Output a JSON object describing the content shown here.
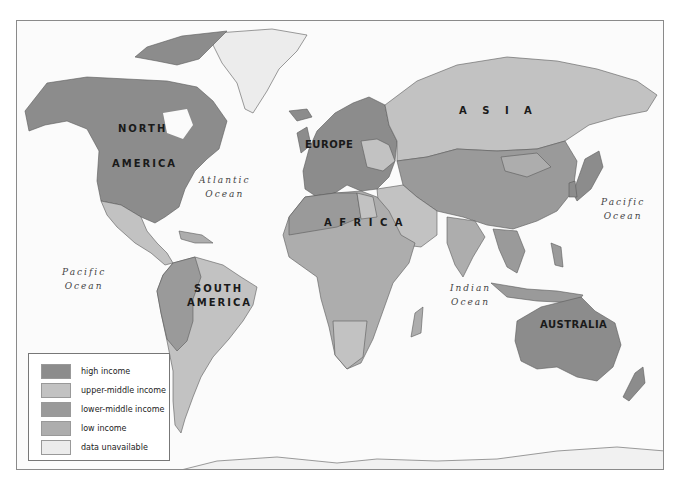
{
  "map": {
    "type": "choropleth world map",
    "colors": {
      "high": "#8c8c8c",
      "upper_middle": "#c2c2c2",
      "lower_middle": "#9a9a9a",
      "low": "#adadad",
      "unavailable": "#ececec",
      "water": "#fbfbfb",
      "border": "#555555"
    },
    "continent_labels": {
      "north_america_1": "NORTH",
      "north_america_2": "AMERICA",
      "south_america_1": "SOUTH",
      "south_america_2": "AMERICA",
      "europe": "EUROPE",
      "africa": "A F R I C A",
      "asia": "A  S  I  A",
      "australia": "AUSTRALIA"
    },
    "ocean_labels": {
      "atlantic_1": "Atlantic",
      "atlantic_2": "Ocean",
      "pacific_east_1": "Pacific",
      "pacific_east_2": "Ocean",
      "pacific_west_1": "Pacific",
      "pacific_west_2": "Ocean",
      "indian_1": "Indian",
      "indian_2": "Ocean"
    }
  },
  "legend": {
    "items": [
      {
        "label": "high income",
        "color": "#8c8c8c"
      },
      {
        "label": "upper-middle income",
        "color": "#c2c2c2"
      },
      {
        "label": "lower-middle income",
        "color": "#9a9a9a"
      },
      {
        "label": "low income",
        "color": "#adadad"
      },
      {
        "label": "data unavailable",
        "color": "#ececec"
      }
    ]
  }
}
